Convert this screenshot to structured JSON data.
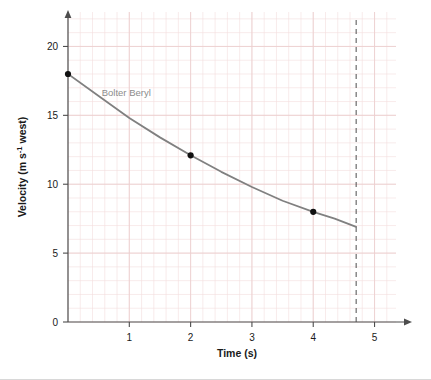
{
  "chart_data": {
    "type": "line",
    "title": "",
    "xlabel": "Time (s)",
    "ylabel_main": "Velocity (m s",
    "ylabel_exponent": "-1",
    "ylabel_tail": " west)",
    "ylabel_full": "Velocity (m s-1 west)",
    "xlim": [
      0,
      5.35
    ],
    "ylim": [
      0,
      22.5
    ],
    "xticks": [
      1,
      2,
      3,
      4,
      5
    ],
    "xtick_labels": [
      "1",
      "2",
      "3",
      "4",
      "5"
    ],
    "yticks": [
      0,
      5,
      10,
      15,
      20
    ],
    "ytick_labels": [
      "0",
      "5",
      "10",
      "15",
      "20"
    ],
    "grid": true,
    "grid_minor_spacing_x": 0.2,
    "grid_minor_spacing_y": 1,
    "grid_color": "#f0d9d9",
    "legend_position": "inline-annotation",
    "series": [
      {
        "name": "Bolter Beryl",
        "color": "#808080",
        "label_x": 0.55,
        "label_y": 16.4,
        "line": [
          {
            "x": 0.0,
            "y": 18.0
          },
          {
            "x": 0.5,
            "y": 16.4
          },
          {
            "x": 1.0,
            "y": 14.8
          },
          {
            "x": 1.5,
            "y": 13.4
          },
          {
            "x": 2.0,
            "y": 12.1
          },
          {
            "x": 2.5,
            "y": 10.9
          },
          {
            "x": 3.0,
            "y": 9.8
          },
          {
            "x": 3.5,
            "y": 8.8
          },
          {
            "x": 4.0,
            "y": 8.0
          },
          {
            "x": 4.35,
            "y": 7.5
          },
          {
            "x": 4.7,
            "y": 6.9
          }
        ],
        "points": [
          {
            "x": 0.0,
            "y": 18.0
          },
          {
            "x": 2.0,
            "y": 12.1
          },
          {
            "x": 4.0,
            "y": 8.0
          }
        ]
      }
    ],
    "markers": [
      {
        "type": "vertical-dashed-line",
        "x": 4.7,
        "color": "#4d4d4d"
      }
    ]
  }
}
